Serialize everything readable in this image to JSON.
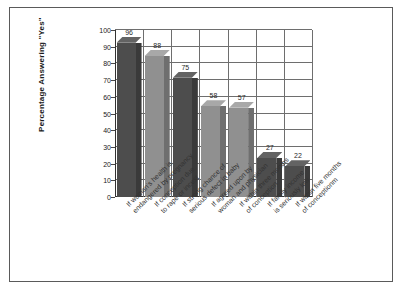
{
  "chart_data": {
    "type": "bar",
    "title": "",
    "subtitle": "",
    "xlabel": "",
    "ylabel": "Percentage Answering \"Yes\"",
    "ylim": [
      0,
      100
    ],
    "yticks": [
      0,
      10,
      20,
      30,
      40,
      50,
      60,
      70,
      80,
      90,
      100
    ],
    "grid": "horizontal",
    "legend": "none",
    "value_labels_shown": true,
    "style": "3d-bars",
    "categories": [
      "If woman's health is endangered by pregnancy",
      "If conception due to rape or incest",
      "If strong chance of serious defect in baby",
      "If agreed upon by woman and physician",
      "If within three months of conception",
      "If family income is seriously low",
      "If within five months of conceptionm"
    ],
    "category_lines": [
      [
        "If woman's health is",
        "endangered by pregnancy"
      ],
      [
        "If conception due",
        "to rape or incest"
      ],
      [
        "If strong chance of",
        "serious defect in baby"
      ],
      [
        "If agreed upon by",
        "woman and physician"
      ],
      [
        "If within three months",
        "of conception"
      ],
      [
        "If family income",
        "is seriously low"
      ],
      [
        "If within five months",
        "of conceptionm"
      ]
    ],
    "values": [
      96,
      88,
      75,
      58,
      57,
      27,
      22
    ],
    "bar_shades": [
      "dark",
      "light",
      "dark",
      "light",
      "light",
      "dark",
      "dark"
    ],
    "colors": {
      "bar_dark": "#4d4d4d",
      "bar_light": "#909090",
      "grid": "#6e6e6e",
      "axis": "#333333",
      "frame": "#5a5a5a",
      "background": "#ffffff",
      "text": "#222222"
    }
  }
}
